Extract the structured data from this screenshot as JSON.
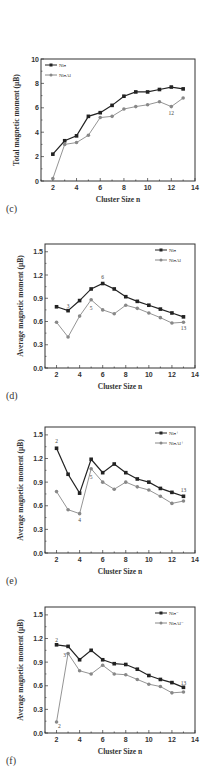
{
  "chart_data": [
    {
      "id": "c",
      "type": "line",
      "panel_label": "(c)",
      "title": "",
      "xlabel": "Cluster Size n",
      "ylabel": "Total magnetic moment (μB)",
      "xlim": [
        1,
        14
      ],
      "ylim": [
        0,
        10
      ],
      "xticks": [
        2,
        4,
        6,
        8,
        10,
        12,
        14
      ],
      "yticks": [
        0,
        2,
        4,
        6,
        8,
        10
      ],
      "ytick_labels": [
        "0",
        "2",
        "4",
        "6",
        "8",
        "10"
      ],
      "grid": false,
      "legend_position": "upper left",
      "x": [
        2,
        3,
        4,
        5,
        6,
        7,
        8,
        9,
        10,
        11,
        12,
        13
      ],
      "series": [
        {
          "name": "Niₙ",
          "color": "#222222",
          "marker": "square",
          "values": [
            2.2,
            3.3,
            3.7,
            5.3,
            5.6,
            6.2,
            6.95,
            7.3,
            7.3,
            7.5,
            7.7,
            7.55
          ]
        },
        {
          "name": "NiₙAl",
          "color": "#888888",
          "marker": "circle",
          "values": [
            0.2,
            3.0,
            3.15,
            3.75,
            5.2,
            5.3,
            5.9,
            6.1,
            6.25,
            6.5,
            6.1,
            6.8
          ]
        }
      ],
      "annotations": [
        {
          "text": "12",
          "x": 12,
          "y": 5.55,
          "series": 1
        }
      ]
    },
    {
      "id": "d",
      "type": "line",
      "panel_label": "(d)",
      "title": "",
      "xlabel": "Cluster Size n",
      "ylabel": "Average magnetic moment (μB)",
      "xlim": [
        1,
        14
      ],
      "ylim": [
        0,
        1.6
      ],
      "xticks": [
        2,
        4,
        6,
        8,
        10,
        12,
        14
      ],
      "yticks": [
        0,
        0.3,
        0.6,
        0.9,
        1.2,
        1.5
      ],
      "ytick_labels": [
        "0.0",
        "0.3",
        "0.6",
        "0.9",
        "1.2",
        "1.5"
      ],
      "grid": false,
      "legend_position": "upper right",
      "x": [
        2,
        3,
        4,
        5,
        6,
        7,
        8,
        9,
        10,
        11,
        12,
        13
      ],
      "series": [
        {
          "name": "Niₙ",
          "color": "#222222",
          "marker": "square",
          "values": [
            0.79,
            0.74,
            0.87,
            1.02,
            1.09,
            1.02,
            0.92,
            0.86,
            0.81,
            0.76,
            0.71,
            0.66
          ]
        },
        {
          "name": "NiₙAl",
          "color": "#888888",
          "marker": "circle",
          "values": [
            0.59,
            0.4,
            0.67,
            0.88,
            0.75,
            0.7,
            0.81,
            0.77,
            0.71,
            0.65,
            0.58,
            0.59
          ]
        }
      ],
      "annotations": [
        {
          "text": "3",
          "x": 3,
          "y": 0.8,
          "series": 0
        },
        {
          "text": "6",
          "x": 6,
          "y": 1.17,
          "series": 0
        },
        {
          "text": "5",
          "x": 5,
          "y": 0.78,
          "series": 1
        },
        {
          "text": "13",
          "x": 13,
          "y": 0.52,
          "series": 1
        }
      ]
    },
    {
      "id": "e",
      "type": "line",
      "panel_label": "(e)",
      "title": "",
      "xlabel": "Cluster Size n",
      "ylabel": "Average magnetic moment (μB)",
      "xlim": [
        1,
        14
      ],
      "ylim": [
        0,
        1.6
      ],
      "xticks": [
        2,
        4,
        6,
        8,
        10,
        12,
        14
      ],
      "yticks": [
        0,
        0.3,
        0.6,
        0.9,
        1.2,
        1.5
      ],
      "ytick_labels": [
        "0.0",
        "0.3",
        "0.6",
        "0.9",
        "1.2",
        "1.5"
      ],
      "grid": false,
      "legend_position": "upper right",
      "x": [
        2,
        3,
        4,
        5,
        6,
        7,
        8,
        9,
        10,
        11,
        12,
        13
      ],
      "series": [
        {
          "name": "Niₙ⁺",
          "color": "#222222",
          "marker": "square",
          "values": [
            1.33,
            1.0,
            0.76,
            1.19,
            1.02,
            1.13,
            1.02,
            0.94,
            0.9,
            0.82,
            0.77,
            0.72
          ]
        },
        {
          "name": "NiₙAl⁺",
          "color": "#888888",
          "marker": "circle",
          "values": [
            0.78,
            0.55,
            0.5,
            1.07,
            0.9,
            0.81,
            0.9,
            0.84,
            0.8,
            0.72,
            0.63,
            0.66
          ]
        }
      ],
      "annotations": [
        {
          "text": "2",
          "x": 2,
          "y": 1.42,
          "series": 0
        },
        {
          "text": "5",
          "x": 5,
          "y": 0.96,
          "series": 1
        },
        {
          "text": "4",
          "x": 4,
          "y": 0.42,
          "series": 1
        },
        {
          "text": "13",
          "x": 13,
          "y": 0.8,
          "series": 0
        }
      ]
    },
    {
      "id": "f",
      "type": "line",
      "panel_label": "(f)",
      "title": "",
      "xlabel": "Cluster Size n",
      "ylabel": "Average magnetic moment (μB)",
      "xlim": [
        1,
        14
      ],
      "ylim": [
        0,
        1.6
      ],
      "xticks": [
        2,
        4,
        6,
        8,
        10,
        12,
        14
      ],
      "yticks": [
        0,
        0.3,
        0.6,
        0.9,
        1.2,
        1.5
      ],
      "ytick_labels": [
        "0.0",
        "0.3",
        "0.6",
        "0.9",
        "1.2",
        "1.5"
      ],
      "grid": false,
      "legend_position": "upper right",
      "x": [
        2,
        3,
        4,
        5,
        6,
        7,
        8,
        9,
        10,
        11,
        12,
        13
      ],
      "series": [
        {
          "name": "Niₙ⁻",
          "color": "#222222",
          "marker": "square",
          "values": [
            1.12,
            1.1,
            0.93,
            1.05,
            0.93,
            0.88,
            0.87,
            0.81,
            0.73,
            0.68,
            0.64,
            0.58
          ]
        },
        {
          "name": "NiₙAl⁻",
          "color": "#888888",
          "marker": "circle",
          "values": [
            0.14,
            1.01,
            0.79,
            0.75,
            0.86,
            0.75,
            0.74,
            0.68,
            0.62,
            0.59,
            0.51,
            0.52
          ]
        }
      ],
      "annotations": [
        {
          "text": "2",
          "x": 2,
          "y": 1.18,
          "series": 0
        },
        {
          "text": "3",
          "x": 2.7,
          "y": 0.99,
          "series": 1
        },
        {
          "text": "2",
          "x": 2.25,
          "y": 0.09,
          "series": 1
        },
        {
          "text": "13",
          "x": 13,
          "y": 0.64,
          "series": 0
        }
      ]
    }
  ],
  "layout": {
    "panels": [
      {
        "id": "c",
        "frame": {
          "left": 41,
          "right": 195,
          "top": 59,
          "bottom": 181
        },
        "label_top": 203
      },
      {
        "id": "d",
        "frame": {
          "left": 45,
          "right": 195,
          "top": 244,
          "bottom": 368
        },
        "label_top": 390
      },
      {
        "id": "e",
        "frame": {
          "left": 45,
          "right": 195,
          "top": 427,
          "bottom": 553
        },
        "label_top": 575
      },
      {
        "id": "f",
        "frame": {
          "left": 45,
          "right": 195,
          "top": 607,
          "bottom": 733
        },
        "label_top": 755
      }
    ]
  }
}
